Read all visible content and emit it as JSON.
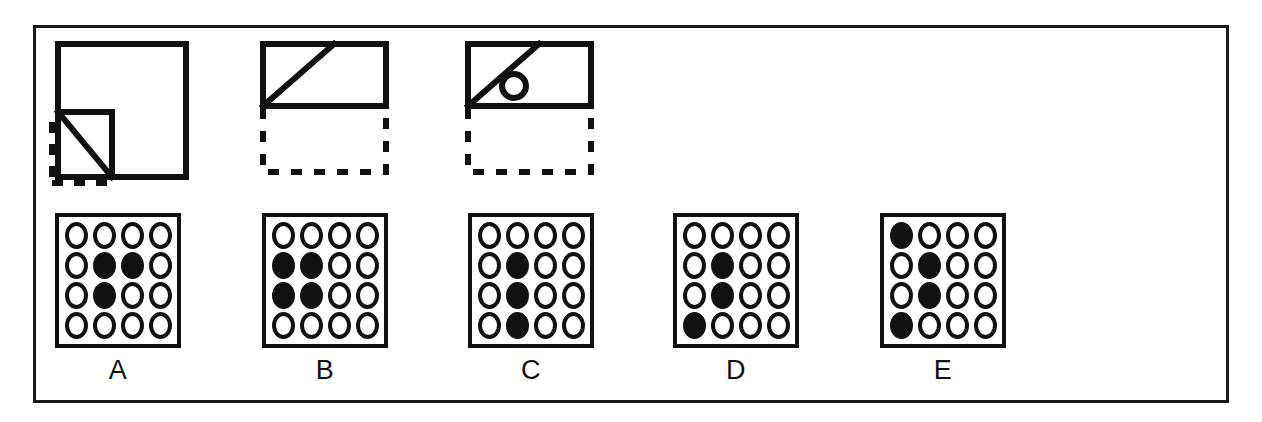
{
  "page": {
    "background_color": "#ffffff",
    "ink_color": "#111111",
    "frame": {
      "x": 33,
      "y": 25,
      "width": 1196,
      "height": 378,
      "stroke_width": 3
    }
  },
  "stimulus": {
    "name": "paper-folding-sequence",
    "count": 3,
    "figures": [
      {
        "id": "figure-1",
        "name": "folded-square-corner",
        "description": "Large solid square with a folded-up lower-left corner forming a triangle; dashed lines show the original lower-left region",
        "solid_outline": "square",
        "dashed_outline": "lower-left-corner",
        "has_circle": false,
        "has_diagonal": true
      },
      {
        "id": "figure-2",
        "name": "folded-rectangle-diagonal",
        "description": "Solid rectangle with a diagonal crease from bottom-left to top; dashed rectangle below shows the folded-away half",
        "solid_outline": "rectangle",
        "dashed_outline": "rectangle-below",
        "has_circle": false,
        "has_diagonal": true
      },
      {
        "id": "figure-3",
        "name": "punched-rectangle-with-hole",
        "description": "Solid rectangle with a diagonal crease and a small punched circle to the right of the diagonal; dashed rectangle below",
        "solid_outline": "rectangle",
        "dashed_outline": "rectangle-below",
        "has_circle": true,
        "has_diagonal": true
      }
    ]
  },
  "options": {
    "name": "answer-choices",
    "grid": {
      "rows": 4,
      "cols": 4
    },
    "items": [
      {
        "label": "A",
        "name": "option-a",
        "filled_cells": [
          [
            1,
            1
          ],
          [
            1,
            2
          ],
          [
            2,
            1
          ]
        ],
        "pattern": [
          [
            0,
            0,
            0,
            0
          ],
          [
            0,
            1,
            1,
            0
          ],
          [
            0,
            1,
            0,
            0
          ],
          [
            0,
            0,
            0,
            0
          ]
        ]
      },
      {
        "label": "B",
        "name": "option-b",
        "filled_cells": [
          [
            1,
            0
          ],
          [
            1,
            1
          ],
          [
            2,
            0
          ],
          [
            2,
            1
          ]
        ],
        "pattern": [
          [
            0,
            0,
            0,
            0
          ],
          [
            1,
            1,
            0,
            0
          ],
          [
            1,
            1,
            0,
            0
          ],
          [
            0,
            0,
            0,
            0
          ]
        ]
      },
      {
        "label": "C",
        "name": "option-c",
        "filled_cells": [
          [
            1,
            1
          ],
          [
            2,
            1
          ],
          [
            3,
            1
          ]
        ],
        "pattern": [
          [
            0,
            0,
            0,
            0
          ],
          [
            0,
            1,
            0,
            0
          ],
          [
            0,
            1,
            0,
            0
          ],
          [
            0,
            1,
            0,
            0
          ]
        ]
      },
      {
        "label": "D",
        "name": "option-d",
        "filled_cells": [
          [
            1,
            1
          ],
          [
            2,
            1
          ],
          [
            3,
            0
          ]
        ],
        "pattern": [
          [
            0,
            0,
            0,
            0
          ],
          [
            0,
            1,
            0,
            0
          ],
          [
            0,
            1,
            0,
            0
          ],
          [
            1,
            0,
            0,
            0
          ]
        ]
      },
      {
        "label": "E",
        "name": "option-e",
        "filled_cells": [
          [
            0,
            0
          ],
          [
            1,
            1
          ],
          [
            2,
            1
          ],
          [
            3,
            0
          ]
        ],
        "pattern": [
          [
            1,
            0,
            0,
            0
          ],
          [
            0,
            1,
            0,
            0
          ],
          [
            0,
            1,
            0,
            0
          ],
          [
            1,
            0,
            0,
            0
          ]
        ]
      }
    ]
  }
}
